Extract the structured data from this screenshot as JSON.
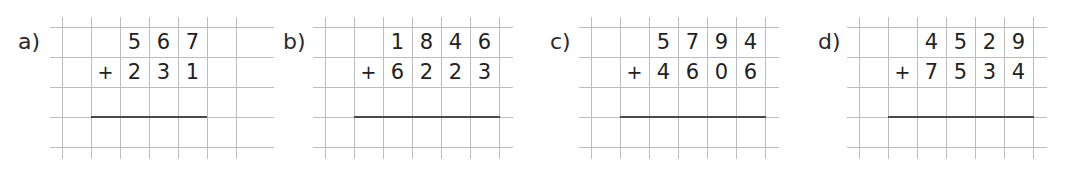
{
  "page": {
    "type": "column-addition-worksheet",
    "colors": {
      "grid_line": "#bdbdbd",
      "text": "#222222",
      "sum_line": "#4a4a4a",
      "background": "#ffffff"
    }
  },
  "exercises": [
    {
      "label": "a)",
      "operator": "+",
      "top_digits": [
        "",
        "",
        "5",
        "6",
        "7",
        ""
      ],
      "bottom_digits": [
        "",
        "",
        "2",
        "3",
        "1",
        ""
      ],
      "addend_1": "567",
      "addend_2": "231",
      "answer": ""
    },
    {
      "label": "b)",
      "operator": "+",
      "top_digits": [
        "",
        "",
        "1",
        "8",
        "4",
        "6"
      ],
      "bottom_digits": [
        "",
        "",
        "6",
        "2",
        "2",
        "3"
      ],
      "addend_1": "1846",
      "addend_2": "6223",
      "answer": ""
    },
    {
      "label": "c)",
      "operator": "+",
      "top_digits": [
        "",
        "",
        "5",
        "7",
        "9",
        "4"
      ],
      "bottom_digits": [
        "",
        "",
        "4",
        "6",
        "0",
        "6"
      ],
      "addend_1": "5794",
      "addend_2": "4606",
      "answer": ""
    },
    {
      "label": "d)",
      "operator": "+",
      "top_digits": [
        "",
        "",
        "4",
        "5",
        "2",
        "9"
      ],
      "bottom_digits": [
        "",
        "",
        "7",
        "5",
        "3",
        "4"
      ],
      "addend_1": "4529",
      "addend_2": "7534",
      "answer": ""
    }
  ]
}
